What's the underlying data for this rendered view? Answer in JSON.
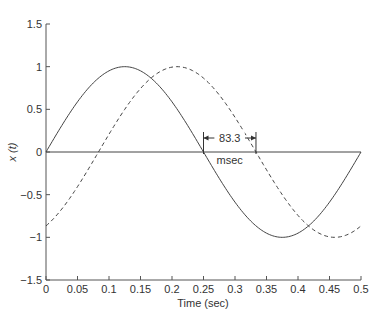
{
  "chart_data": {
    "type": "line",
    "title": "",
    "xlabel": "Time (sec)",
    "ylabel": "x (t)",
    "xlim": [
      0,
      0.5
    ],
    "ylim": [
      -1.5,
      1.5
    ],
    "xticks": [
      "0",
      "0.05",
      "0.1",
      "0.15",
      "0.2",
      "0.25",
      "0.3",
      "0.35",
      "0.4",
      "0.45",
      "0.5"
    ],
    "yticks": [
      "1.5",
      "1",
      "0.5",
      "0",
      "−0.5",
      "−1",
      "−1.5"
    ],
    "grid": false,
    "series": [
      {
        "name": "x(t) = sin(4πt)",
        "style": "solid",
        "frequency_hz": 2,
        "amplitude": 1,
        "delay_sec": 0,
        "x": [
          0,
          0.0625,
          0.125,
          0.1875,
          0.25,
          0.3125,
          0.375,
          0.4375,
          0.5
        ],
        "values": [
          0,
          0.707,
          1,
          0.707,
          0,
          -0.707,
          -1,
          -0.707,
          0
        ]
      },
      {
        "name": "delayed x(t − 0.0833)",
        "style": "dashed",
        "frequency_hz": 2,
        "amplitude": 1,
        "delay_sec": 0.0833,
        "x": [
          0,
          0.0833,
          0.1458,
          0.2083,
          0.2708,
          0.3333,
          0.3958,
          0.4583,
          0.5
        ],
        "values": [
          -0.866,
          0,
          0.707,
          1,
          0.707,
          0,
          -0.707,
          -1,
          -0.866
        ]
      }
    ],
    "annotations": [
      {
        "text_value": "83.3",
        "text_unit": "msec",
        "from_x": 0.25,
        "to_x": 0.3333,
        "y": 0
      }
    ]
  }
}
